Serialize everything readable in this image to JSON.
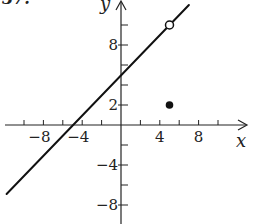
{
  "chart_data": {
    "type": "line",
    "title": "",
    "xlabel": "x",
    "ylabel": "y",
    "xlim": [
      -12,
      12
    ],
    "ylim": [
      -10,
      12
    ],
    "grid": false,
    "x_ticks": [
      -10,
      -8,
      -6,
      -4,
      -2,
      2,
      4,
      6,
      8,
      10
    ],
    "x_tick_labels": [
      {
        "value": -8,
        "label": "−8"
      },
      {
        "value": -4,
        "label": "−4"
      },
      {
        "value": 4,
        "label": "4"
      },
      {
        "value": 8,
        "label": "8"
      }
    ],
    "y_ticks": [
      -8,
      -6,
      -4,
      -2,
      2,
      4,
      6,
      8,
      10
    ],
    "y_tick_labels": [
      {
        "value": 8,
        "label": "8"
      },
      {
        "value": 2,
        "label": "2"
      },
      {
        "value": -4,
        "label": "−4"
      },
      {
        "value": -8,
        "label": "−8"
      }
    ],
    "series": [
      {
        "name": "y = x + 5 (x ≠ 5)",
        "kind": "line",
        "equation": "y = x + 5",
        "x": [
          -12,
          7
        ],
        "y": [
          -7,
          12
        ]
      }
    ],
    "points": [
      {
        "x": 5,
        "y": 10,
        "style": "open",
        "note": "hole in line"
      },
      {
        "x": 5,
        "y": 2,
        "style": "filled",
        "note": "defined value"
      }
    ],
    "annotations": [
      {
        "text": "y",
        "position": "top of y-axis"
      },
      {
        "text": "x",
        "position": "right end of x-axis"
      }
    ]
  },
  "partial_header_text": "37."
}
